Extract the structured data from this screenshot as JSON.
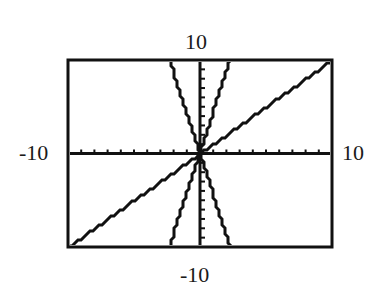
{
  "chart_data": {
    "type": "line",
    "title": "",
    "xlabel": "",
    "ylabel": "",
    "xlim": [
      -10,
      10
    ],
    "ylim": [
      -10,
      10
    ],
    "grid": false,
    "axes": {
      "x_ticks_every": 1,
      "y_ticks_every": 1
    },
    "window_labels": {
      "xmin": "-10",
      "xmax": "10",
      "ymin": "-10",
      "ymax": "10"
    },
    "slope_note": "Slopes are estimated from pixel positions on a square-window screen; the exact function equations are not shown in the image.",
    "series": [
      {
        "name": "shallow increasing line through origin",
        "slope_estimate": 1.0,
        "intercept": 0,
        "x": [
          -10,
          10
        ],
        "y": [
          -10,
          10
        ]
      },
      {
        "name": "steep increasing line through origin",
        "slope_estimate": 4.4,
        "intercept": 0,
        "x": [
          -2.3,
          2.3
        ],
        "y": [
          -10,
          10
        ]
      },
      {
        "name": "steep decreasing line through origin",
        "slope_estimate": -4.4,
        "intercept": 0,
        "x": [
          -2.3,
          2.3
        ],
        "y": [
          10,
          -10
        ]
      }
    ]
  },
  "labels": {
    "top": "10",
    "bottom": "-10",
    "left": "-10",
    "right": "10"
  },
  "colors": {
    "ink": "#111111",
    "background": "#ffffff"
  }
}
